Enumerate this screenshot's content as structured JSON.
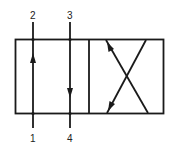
{
  "diagram": {
    "type": "4/2 directional control valve symbol",
    "colors": {
      "stroke": "#1a1a1a",
      "background": "#ffffff"
    },
    "ports": {
      "top_left": "2",
      "top_right": "3",
      "bottom_left": "1",
      "bottom_right": "4"
    },
    "envelopes": [
      {
        "name": "left-envelope",
        "flows": [
          "1 → 2 (up)",
          "3 → 4 (down)"
        ]
      },
      {
        "name": "right-envelope",
        "flows": [
          "crossed paths"
        ]
      }
    ]
  }
}
